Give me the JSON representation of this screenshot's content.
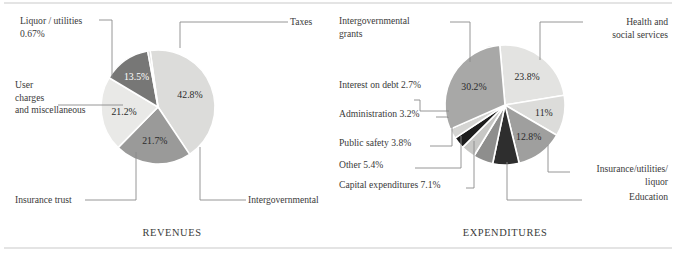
{
  "figure": {
    "title": "",
    "panels": [
      "REVENUES",
      "EXPENDITURES"
    ]
  },
  "chart_data": [
    {
      "type": "pie",
      "title": "REVENUES",
      "caption": "REVENUES",
      "center": [
        158,
        107
      ],
      "radius": 57,
      "start_angle_deg": -8,
      "legend": "callout-labels",
      "grid": false,
      "categories": [
        "Taxes",
        "Intergovernmental",
        "Insurance trust",
        "User charges and miscellaneous",
        "Liquor / utilities"
      ],
      "values": [
        42.8,
        21.7,
        21.2,
        13.5,
        0.67
      ],
      "value_labels": [
        "42.8%",
        "21.7%",
        "21.2%",
        "13.5%",
        ""
      ],
      "colors": [
        "#dcdcda",
        "#9a9a99",
        "#e9e9e7",
        "#777776",
        "#cfcfcd"
      ],
      "slices": [
        {
          "name": "Taxes",
          "value": 42.8,
          "label": "42.8%",
          "color": "#dcdcda",
          "dark": false
        },
        {
          "name": "Intergovernmental",
          "value": 21.7,
          "label": "21.7%",
          "color": "#9a9a99",
          "dark": false
        },
        {
          "name": "Insurance trust",
          "value": 21.2,
          "label": "21.2%",
          "color": "#e9e9e7",
          "dark": false
        },
        {
          "name": "User charges and miscellaneous",
          "value": 13.5,
          "label": "13.5%",
          "color": "#777776",
          "dark": true
        },
        {
          "name": "Liquor / utilities",
          "value": 0.67,
          "label": "",
          "color": "#cfcfcd",
          "dark": false
        }
      ],
      "callouts": [
        {
          "name": "taxes-label",
          "lines": [
            "Taxes"
          ],
          "x": 290,
          "y": 25,
          "align": "start"
        },
        {
          "name": "intergovernmental-label",
          "lines": [
            "Intergovernmental"
          ],
          "x": 248,
          "y": 203,
          "align": "start"
        },
        {
          "name": "insurance-trust-label",
          "lines": [
            "Insurance trust"
          ],
          "x": 15,
          "y": 203,
          "align": "start"
        },
        {
          "name": "user-charges-label",
          "lines": [
            "User",
            "charges",
            "and miscellaneous"
          ],
          "x": 15,
          "y": 88,
          "align": "start"
        },
        {
          "name": "liquor-utilities-label",
          "lines": [
            "Liquor / utilities",
            "0.67%"
          ],
          "x": 20,
          "y": 24,
          "align": "start"
        }
      ]
    },
    {
      "type": "pie",
      "title": "EXPENDITURES",
      "caption": "EXPENDITURES",
      "center": [
        505,
        105
      ],
      "radius": 60,
      "start_angle_deg": -5,
      "legend": "callout-labels",
      "grid": false,
      "categories": [
        "Health and social services",
        "Insurance / utilities / liquor",
        "Education",
        "Capital expenditures",
        "Other",
        "Public safety",
        "Administration",
        "Interest on debt",
        "Intergovernmental grants"
      ],
      "values": [
        23.8,
        11,
        12.8,
        7.1,
        5.4,
        3.8,
        3.2,
        2.7,
        30.2
      ],
      "value_labels": [
        "23.8%",
        "11%",
        "12.8%",
        "",
        "",
        "",
        "",
        "",
        "30.2%"
      ],
      "colors": [
        "#e3e3e1",
        "#dcdcda",
        "#9f9f9e",
        "#2e2e2e",
        "#8e8e8d",
        "#c7c7c5",
        "#1d1d1d",
        "#d5d5d3",
        "#a8a8a7"
      ],
      "slices": [
        {
          "name": "Health and social services",
          "value": 23.8,
          "label": "23.8%",
          "color": "#e3e3e1",
          "dark": false
        },
        {
          "name": "Insurance / utilities / liquor",
          "value": 11.0,
          "label": "11%",
          "color": "#dcdcda",
          "dark": false
        },
        {
          "name": "Education",
          "value": 12.8,
          "label": "12.8%",
          "color": "#9f9f9e",
          "dark": false
        },
        {
          "name": "Capital expenditures",
          "value": 7.1,
          "label": "",
          "color": "#2e2e2e",
          "dark": true
        },
        {
          "name": "Other",
          "value": 5.4,
          "label": "",
          "color": "#8e8e8d",
          "dark": true
        },
        {
          "name": "Public safety",
          "value": 3.8,
          "label": "",
          "color": "#c7c7c5",
          "dark": false
        },
        {
          "name": "Administration",
          "value": 3.2,
          "label": "",
          "color": "#1d1d1d",
          "dark": true
        },
        {
          "name": "Interest on debt",
          "value": 2.7,
          "label": "",
          "color": "#d5d5d3",
          "dark": false
        },
        {
          "name": "Intergovernmental grants",
          "value": 30.2,
          "label": "30.2%",
          "color": "#a8a8a7",
          "dark": false
        }
      ],
      "callouts": [
        {
          "name": "health-social-label",
          "lines": [
            "Health and",
            "social services"
          ],
          "x": 668,
          "y": 25,
          "align": "end"
        },
        {
          "name": "insurance-utilities-label",
          "lines": [
            "Insurance/utilities/",
            "liquor"
          ],
          "x": 668,
          "y": 172,
          "align": "end"
        },
        {
          "name": "education-label",
          "lines": [
            "Education"
          ],
          "x": 668,
          "y": 200,
          "align": "end"
        },
        {
          "name": "capital-expenditures-label",
          "lines": [
            "Capital expenditures 7.1%"
          ],
          "x": 339,
          "y": 188,
          "align": "start"
        },
        {
          "name": "other-label",
          "lines": [
            "Other 5.4%"
          ],
          "x": 339,
          "y": 168,
          "align": "start"
        },
        {
          "name": "public-safety-label",
          "lines": [
            "Public safety 3.8%"
          ],
          "x": 339,
          "y": 146,
          "align": "start"
        },
        {
          "name": "administration-label",
          "lines": [
            "Administration 3.2%"
          ],
          "x": 339,
          "y": 117,
          "align": "start"
        },
        {
          "name": "interest-debt-label",
          "lines": [
            "Interest on debt 2.7%"
          ],
          "x": 339,
          "y": 88,
          "align": "start"
        },
        {
          "name": "intergov-grants-label",
          "lines": [
            "Intergovernmental",
            "grants"
          ],
          "x": 339,
          "y": 24,
          "align": "start"
        }
      ]
    }
  ],
  "leaders": {
    "revenues": [
      {
        "name": "leader-taxes",
        "points": "180,48 180,22 288,22"
      },
      {
        "name": "leader-intergovernmental",
        "points": "200,147 200,200 246,200"
      },
      {
        "name": "leader-insurance-trust",
        "points": "136,152 136,200 85,200"
      },
      {
        "name": "leader-user-charges",
        "points": "123,105 58,105"
      },
      {
        "name": "leader-liquor-utilities",
        "points": "112,78 112,20 99,20"
      }
    ],
    "expenditures": [
      {
        "name": "leader-health-social",
        "points": "540,60 540,22 583,22"
      },
      {
        "name": "leader-insurance-utilities",
        "points": "548,145 548,172 570,172"
      },
      {
        "name": "leader-education",
        "points": "507,162 507,200 582,200"
      },
      {
        "name": "leader-capital-expenditures",
        "points": "474,141 474,188 466,188"
      },
      {
        "name": "leader-other",
        "points": "461,136 461,168 415,168"
      },
      {
        "name": "leader-public-safety",
        "points": "452,127 452,146 430,146"
      },
      {
        "name": "leader-administration",
        "points": "448,118 448,117 436,117"
      },
      {
        "name": "leader-interest-debt",
        "points": "449,111 420,111 420,100 414,100"
      },
      {
        "name": "leader-intergovernmental-grants",
        "points": "470,62 470,22 450,22"
      }
    ]
  },
  "rules": [
    {
      "name": "top-rule",
      "x1": 4,
      "y1": 3,
      "x2": 672,
      "y2": 3
    },
    {
      "name": "bottom-rule",
      "x1": 4,
      "y1": 248,
      "x2": 672,
      "y2": 248
    }
  ],
  "captions": [
    {
      "name": "caption-revenues",
      "text": "REVENUES",
      "x": 172,
      "y": 236
    },
    {
      "name": "caption-expenditures",
      "text": "EXPENDITURES",
      "x": 505,
      "y": 236
    }
  ],
  "colors": {
    "background": "#ffffff",
    "text": "#3a3a3a",
    "rule": "#c9c9c9",
    "leader": "#8a8a8a",
    "wedge_stroke": "#ffffff"
  }
}
